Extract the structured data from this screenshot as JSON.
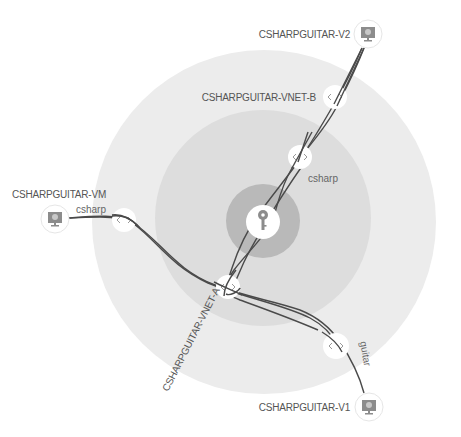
{
  "diagram": {
    "title": "",
    "colors": {
      "background": "#ffffff",
      "outer_ring": "#ececec",
      "middle_ring": "#dddddd",
      "inner_ring": "#b9b9b9",
      "edge": "#4a4a4a",
      "label": "#555555",
      "node_fill": "#ffffff",
      "icon_gray": "#8c8c8c"
    },
    "rings": [
      {
        "name": "outer-ring",
        "cx": 264,
        "cy": 222,
        "r": 172
      },
      {
        "name": "middle-ring",
        "cx": 263,
        "cy": 218,
        "r": 108
      },
      {
        "name": "inner-ring",
        "cx": 263,
        "cy": 221,
        "r": 37
      }
    ],
    "hub": {
      "icon": "key-icon",
      "cx": 263,
      "cy": 222,
      "r": 17
    },
    "vm_nodes": [
      {
        "id": "vm",
        "label": "CSHARPGUITAR-VM",
        "icon": "monitor-icon",
        "cx": 55,
        "cy": 219,
        "label_x": 12,
        "label_y": 198
      },
      {
        "id": "v2",
        "label": "CSHARPGUITAR-V2",
        "icon": "monitor-icon",
        "cx": 368,
        "cy": 34,
        "label_x": 268,
        "label_y": 38
      },
      {
        "id": "v1",
        "label": "CSHARPGUITAR-V1",
        "icon": "monitor-icon",
        "cx": 369,
        "cy": 407,
        "label_x": 268,
        "label_y": 411
      }
    ],
    "gateway_nodes": [
      {
        "id": "vnet-b",
        "label": "CSHARPGUITAR-VNET-B",
        "icon": "code-brackets-icon",
        "cx": 335,
        "cy": 97,
        "r": 12
      },
      {
        "id": "vnet-a",
        "label": "CSHARPGUITAR-VNET-A",
        "icon": "code-brackets-icon",
        "cx": 228,
        "cy": 287,
        "r": 12
      },
      {
        "id": "gw-csharp-b",
        "label": "",
        "icon": "code-brackets-icon",
        "cx": 300,
        "cy": 157,
        "r": 12
      },
      {
        "id": "gw-csharp-vm",
        "label": "",
        "icon": "code-brackets-icon",
        "cx": 124,
        "cy": 220,
        "r": 12
      },
      {
        "id": "gw-guitar",
        "label": "",
        "icon": "code-brackets-icon",
        "cx": 336,
        "cy": 346,
        "r": 13
      }
    ],
    "labels": {
      "vnet_b": "CSHARPGUITAR-VNET-B",
      "vnet_a": "CSHARPGUITAR-VNET-A",
      "vm": "CSHARPGUITAR-VM",
      "v2": "CSHARPGUITAR-V2",
      "v1": "CSHARPGUITAR-V1",
      "edge_csharp_vm": "csharp",
      "edge_csharp_b": "csharp",
      "edge_guitar": "guitar"
    },
    "edges": [
      {
        "from": "CSHARPGUITAR-VM",
        "to": "CSHARPGUITAR-V1",
        "via": [
          "gw-csharp-vm",
          "vnet-a",
          "gw-guitar"
        ],
        "label": "csharp"
      },
      {
        "from": "CSHARPGUITAR-VM",
        "to": "CSHARPGUITAR-VNET-A",
        "via": [
          "gw-csharp-vm"
        ],
        "label": "csharp"
      },
      {
        "from": "CSHARPGUITAR-V2",
        "to": "CSHARPGUITAR-VNET-A",
        "via": [
          "vnet-b",
          "gw-csharp-b",
          "hub"
        ],
        "label": "csharp"
      },
      {
        "from": "CSHARPGUITAR-V2",
        "to": "CSHARPGUITAR-VNET-A",
        "via": [
          "vnet-b",
          "gw-csharp-b"
        ],
        "label": "csharp"
      },
      {
        "from": "CSHARPGUITAR-VNET-A",
        "to": "CSHARPGUITAR-V1",
        "via": [
          "gw-guitar"
        ],
        "label": "guitar"
      }
    ]
  }
}
